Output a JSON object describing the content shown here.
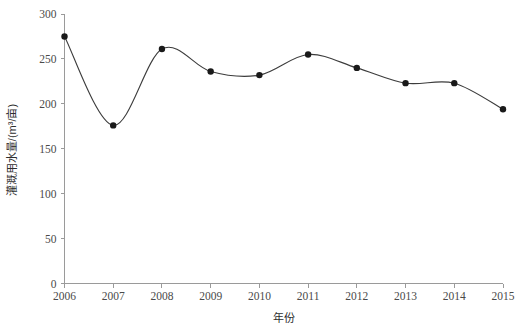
{
  "chart_data": {
    "type": "line",
    "title": "",
    "xlabel": "年份",
    "ylabel": "灌溉用水量/(m³/亩)",
    "categories": [
      "2006",
      "2007",
      "2008",
      "2009",
      "2010",
      "2011",
      "2012",
      "2013",
      "2014",
      "2015"
    ],
    "x": [
      2006,
      2007,
      2008,
      2009,
      2010,
      2011,
      2012,
      2013,
      2014,
      2015
    ],
    "values": [
      275,
      176,
      261,
      236,
      232,
      255,
      240,
      223,
      223,
      194
    ],
    "series": [
      {
        "name": "灌溉用水量",
        "values": [
          275,
          176,
          261,
          236,
          232,
          255,
          240,
          223,
          223,
          194
        ]
      }
    ],
    "ylim": [
      0,
      300
    ],
    "yticks": [
      0,
      50,
      100,
      150,
      200,
      250,
      300
    ],
    "ytick_labels": [
      "0",
      "50",
      "100",
      "150",
      "200",
      "250",
      "300"
    ],
    "xtick_labels": [
      "2006",
      "2007",
      "2008",
      "2009",
      "2010",
      "2011",
      "2012",
      "2013",
      "2014",
      "2015"
    ],
    "grid": false,
    "legend": false,
    "legend_position": "none",
    "smoothing": "spline",
    "marker": "filled-circle",
    "line_color": "#3c3c3c",
    "marker_color": "#1a1a1a",
    "axis_color": "#9a9a9a",
    "background_color": "#ffffff"
  },
  "axes": {
    "x_axis_title": "年份",
    "y_axis_title": "灌溉用水量/(m³/亩)"
  }
}
